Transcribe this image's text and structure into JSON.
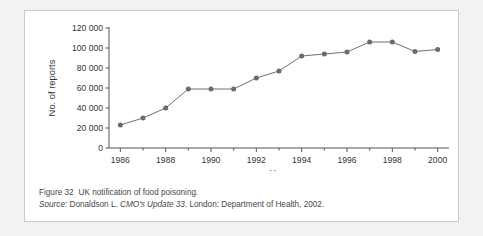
{
  "figure": {
    "caption_label": "Figure 32",
    "caption_title": "UK notification of food poisoning.",
    "source_label": "Source:",
    "source_author": "Donaldson L.",
    "source_publication": "CMO's Update 33",
    "source_rest": ". London: Department of Health, 2002."
  },
  "colors": {
    "line": "#6f6f6f",
    "marker": "#6b6b6b",
    "axis": "#555555",
    "text": "#333333",
    "card_border": "#c9c9c9",
    "page_background": "#f2f2f2",
    "card_background": "#ffffff"
  },
  "chart_data": {
    "type": "line",
    "title": "",
    "xlabel": "Year",
    "ylabel": "No. of reports",
    "x": [
      1986,
      1987,
      1988,
      1989,
      1990,
      1991,
      1992,
      1993,
      1994,
      1995,
      1996,
      1997,
      1998,
      1999,
      2000
    ],
    "values": [
      23000,
      30000,
      40000,
      59000,
      59000,
      59000,
      70000,
      77000,
      92000,
      94000,
      96000,
      106000,
      106000,
      96500,
      98500
    ],
    "series": [
      {
        "name": "No. of reports",
        "values": [
          23000,
          30000,
          40000,
          59000,
          59000,
          59000,
          70000,
          77000,
          92000,
          94000,
          96000,
          106000,
          106000,
          96500,
          98500
        ]
      }
    ],
    "xlim": [
      1985.5,
      2000.5
    ],
    "ylim": [
      0,
      120000
    ],
    "ytick_values": [
      0,
      20000,
      40000,
      60000,
      80000,
      100000,
      120000
    ],
    "ytick_labels": [
      "0",
      "20 000",
      "40 000",
      "60 000",
      "80 000",
      "100 000",
      "120 000"
    ],
    "xtick_values": [
      1986,
      1988,
      1990,
      1992,
      1994,
      1996,
      1998,
      2000
    ],
    "xtick_labels": [
      "1986",
      "1988",
      "1990",
      "1992",
      "1994",
      "1996",
      "1998",
      "2000"
    ],
    "xminor_values": [
      1987,
      1989,
      1991,
      1993,
      1995,
      1997,
      1999
    ],
    "grid": false,
    "legend": false,
    "marker": "circle"
  }
}
